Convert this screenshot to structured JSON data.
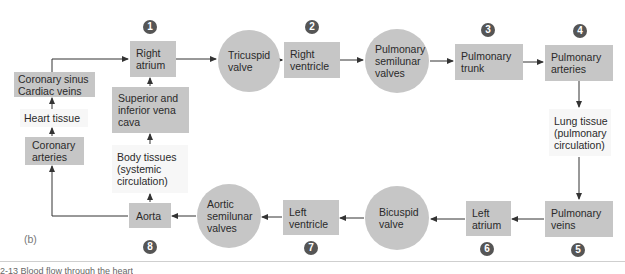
{
  "figure_label": "(b)",
  "caption_fragment": "2-13  Blood flow through the heart",
  "colors": {
    "node_fill": "#c6c6c6",
    "tissue_fill": "#f7f7f7",
    "badge_fill": "#555555",
    "arrow": "#333333"
  },
  "nodes": {
    "right_atrium": {
      "lines": [
        "Right",
        "atrium"
      ],
      "step": "1",
      "shape": "box"
    },
    "tricuspid_valve": {
      "lines": [
        "Tricuspid",
        "valve"
      ],
      "shape": "circle"
    },
    "right_ventricle": {
      "lines": [
        "Right",
        "ventricle"
      ],
      "step": "2",
      "shape": "box"
    },
    "pulmonary_semilunar_valves": {
      "lines": [
        "Pulmonary",
        "semilunar",
        "valves"
      ],
      "shape": "circle"
    },
    "pulmonary_trunk": {
      "lines": [
        "Pulmonary",
        "trunk"
      ],
      "step": "3",
      "shape": "box"
    },
    "pulmonary_arteries": {
      "lines": [
        "Pulmonary",
        "arteries"
      ],
      "step": "4",
      "shape": "box"
    },
    "lung_tissue": {
      "lines": [
        "Lung tissue",
        "(pulmonary",
        "circulation)"
      ],
      "shape": "plain"
    },
    "pulmonary_veins": {
      "lines": [
        "Pulmonary",
        "veins"
      ],
      "step": "5",
      "shape": "box"
    },
    "left_atrium": {
      "lines": [
        "Left",
        "atrium"
      ],
      "step": "6",
      "shape": "box"
    },
    "bicuspid_valve": {
      "lines": [
        "Bicuspid",
        "valve"
      ],
      "shape": "circle"
    },
    "left_ventricle": {
      "lines": [
        "Left",
        "ventricle"
      ],
      "step": "7",
      "shape": "box"
    },
    "aortic_semilunar_valves": {
      "lines": [
        "Aortic",
        "semilunar",
        "valves"
      ],
      "shape": "circle"
    },
    "aorta": {
      "lines": [
        "Aorta"
      ],
      "step": "8",
      "shape": "box"
    },
    "body_tissues": {
      "lines": [
        "Body tissues",
        "(systemic",
        "circulation)"
      ],
      "shape": "plain"
    },
    "vena_cava": {
      "lines": [
        "Superior and",
        "inferior vena",
        "cava"
      ],
      "shape": "box"
    },
    "coronary_arteries": {
      "lines": [
        "Coronary",
        "arteries"
      ],
      "shape": "box"
    },
    "heart_tissue": {
      "lines": [
        "Heart tissue"
      ],
      "shape": "plain"
    },
    "coronary_sinus": {
      "lines": [
        "Coronary sinus",
        "Cardiac veins"
      ],
      "shape": "box"
    }
  },
  "edges": [
    [
      "right_atrium",
      "tricuspid_valve"
    ],
    [
      "tricuspid_valve",
      "right_ventricle"
    ],
    [
      "right_ventricle",
      "pulmonary_semilunar_valves"
    ],
    [
      "pulmonary_semilunar_valves",
      "pulmonary_trunk"
    ],
    [
      "pulmonary_trunk",
      "pulmonary_arteries"
    ],
    [
      "pulmonary_arteries",
      "lung_tissue"
    ],
    [
      "lung_tissue",
      "pulmonary_veins"
    ],
    [
      "pulmonary_veins",
      "left_atrium"
    ],
    [
      "left_atrium",
      "bicuspid_valve"
    ],
    [
      "bicuspid_valve",
      "left_ventricle"
    ],
    [
      "left_ventricle",
      "aortic_semilunar_valves"
    ],
    [
      "aortic_semilunar_valves",
      "aorta"
    ],
    [
      "aorta",
      "body_tissues"
    ],
    [
      "body_tissues",
      "vena_cava"
    ],
    [
      "vena_cava",
      "right_atrium"
    ],
    [
      "aorta",
      "coronary_arteries"
    ],
    [
      "coronary_arteries",
      "heart_tissue"
    ],
    [
      "heart_tissue",
      "coronary_sinus"
    ],
    [
      "coronary_sinus",
      "right_atrium"
    ]
  ]
}
